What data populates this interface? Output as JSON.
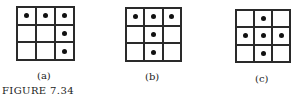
{
  "figure": {
    "caption": "FIGURE 7.34",
    "panels": [
      {
        "label": "(a)",
        "rows": 3,
        "cols": 3,
        "filled": [
          [
            1,
            1,
            1
          ],
          [
            0,
            0,
            1
          ],
          [
            0,
            0,
            1
          ]
        ]
      },
      {
        "label": "(b)",
        "rows": 3,
        "cols": 3,
        "filled": [
          [
            1,
            1,
            1
          ],
          [
            0,
            1,
            0
          ],
          [
            0,
            1,
            0
          ]
        ]
      },
      {
        "label": "(c)",
        "rows": 3,
        "cols": 3,
        "filled": [
          [
            0,
            1,
            0
          ],
          [
            1,
            1,
            1
          ],
          [
            0,
            1,
            0
          ]
        ]
      }
    ]
  }
}
